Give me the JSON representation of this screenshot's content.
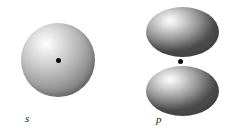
{
  "figure": {
    "background_color": "#ffffff",
    "width": 234,
    "height": 140,
    "caption_style": "italic-serif"
  },
  "orbitals": [
    {
      "id": "s",
      "label": "s",
      "shape": "sphere",
      "lobes": 1,
      "nucleus_marker": "black-dot",
      "shading": "radial-gradient-highlight-upper-left",
      "highlight_color": "#fdfdfd",
      "shadow_color": "#4c4c4c",
      "nucleus_color": "#0a0a0a"
    },
    {
      "id": "p",
      "label": "p",
      "shape": "dumbbell-two-lobes",
      "lobes": 2,
      "lobe_names": [
        "upper-lobe",
        "lower-lobe"
      ],
      "nucleus_marker": "black-dot",
      "shading": "radial-gradient-highlight-upper-left",
      "highlight_color": "#fcfcfc",
      "shadow_color": "#4b4b4b",
      "nucleus_color": "#0a0a0a"
    }
  ]
}
